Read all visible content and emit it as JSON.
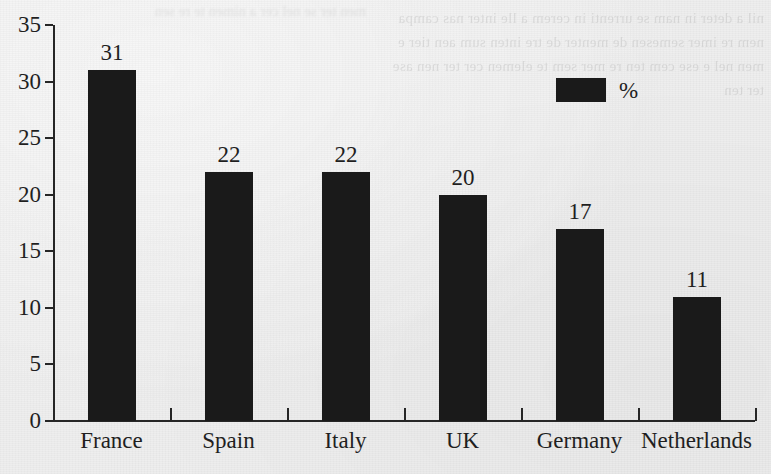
{
  "chart_data": {
    "type": "bar",
    "title": "",
    "subtitle": "",
    "xlabel": "",
    "ylabel": "",
    "categories": [
      "France",
      "Spain",
      "Italy",
      "UK",
      "Germany",
      "Netherlands"
    ],
    "values": [
      31,
      22,
      22,
      20,
      17,
      11
    ],
    "series": [
      {
        "name": "%",
        "values": [
          31,
          22,
          22,
          20,
          17,
          11
        ]
      }
    ],
    "data_labels": [
      "31",
      "22",
      "22",
      "20",
      "17",
      "11"
    ],
    "ylim": [
      0,
      35
    ],
    "ytick_step": 5,
    "ytick_labels": [
      "0",
      "5",
      "10",
      "15",
      "20",
      "25",
      "30",
      "35"
    ],
    "ytick_values": [
      0,
      5,
      10,
      15,
      20,
      25,
      30,
      35
    ],
    "grid": false,
    "legend": {
      "position": "top-right",
      "entries": [
        {
          "label": "%",
          "color": "#1a1a1a",
          "swatch": "filled-rect"
        }
      ]
    },
    "colors": {
      "bar": "#1a1a1a",
      "axis": "#262626",
      "text": "#1f1f1f",
      "background": "#eeeeee"
    }
  },
  "artifacts": {
    "bleed_through_text": "nil a deter in nam se urrenti in cerem a lle inter nas campa nem re imer semesen de menter de tre inten sum aen tier e men nel e ese cem ten re mer sem te elemen cer ter nen ase ter ten",
    "bleed_through_top": "men ter se nel cer a nimen te re sen"
  }
}
